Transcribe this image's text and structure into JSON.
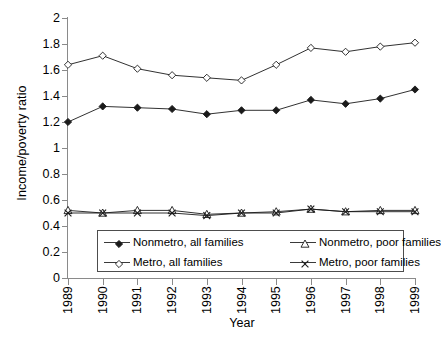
{
  "chart_data": {
    "type": "line",
    "title": "",
    "xlabel": "Year",
    "ylabel": "Income/poverty ratio",
    "grid": false,
    "legend_position": "inside-bottom-center",
    "x": [
      1989,
      1990,
      1991,
      1992,
      1993,
      1994,
      1995,
      1996,
      1997,
      1998,
      1999
    ],
    "xtick_labels": [
      "1989",
      "1990",
      "1991",
      "1992",
      "1993",
      "1994",
      "1995",
      "1996",
      "1997",
      "1998",
      "1999"
    ],
    "ylim": [
      0,
      2
    ],
    "ytick_labels": [
      "0",
      "0.2",
      "0.4",
      "0.6",
      "0.8",
      "1",
      "1.2",
      "1.4",
      "1.6",
      "1.8",
      "2"
    ],
    "ytick_values": [
      0,
      0.2,
      0.4,
      0.6,
      0.8,
      1,
      1.2,
      1.4,
      1.6,
      1.8,
      2
    ],
    "series": [
      {
        "name": "Nonmetro, all families",
        "marker": "filled-diamond",
        "color": "#1a1a1a",
        "values": [
          1.2,
          1.32,
          1.31,
          1.3,
          1.26,
          1.29,
          1.29,
          1.37,
          1.34,
          1.38,
          1.45
        ]
      },
      {
        "name": "Metro, all families",
        "marker": "open-diamond",
        "color": "#1a1a1a",
        "values": [
          1.64,
          1.71,
          1.61,
          1.56,
          1.54,
          1.52,
          1.64,
          1.77,
          1.74,
          1.78,
          1.81
        ]
      },
      {
        "name": "Nonmetro, poor families",
        "marker": "open-triangle",
        "color": "#1a1a1a",
        "values": [
          0.52,
          0.5,
          0.52,
          0.52,
          0.49,
          0.5,
          0.51,
          0.53,
          0.51,
          0.52,
          0.52
        ]
      },
      {
        "name": "Metro, poor families",
        "marker": "cross-x",
        "color": "#1a1a1a",
        "values": [
          0.5,
          0.5,
          0.5,
          0.5,
          0.48,
          0.5,
          0.5,
          0.53,
          0.51,
          0.51,
          0.51
        ]
      }
    ]
  },
  "legend": {
    "items": [
      {
        "label": "Nonmetro, all families",
        "marker": "filled-diamond"
      },
      {
        "label": "Nonmetro, poor families",
        "marker": "open-triangle"
      },
      {
        "label": "Metro, all families",
        "marker": "open-diamond"
      },
      {
        "label": "Metro, poor families",
        "marker": "cross-x"
      }
    ]
  }
}
